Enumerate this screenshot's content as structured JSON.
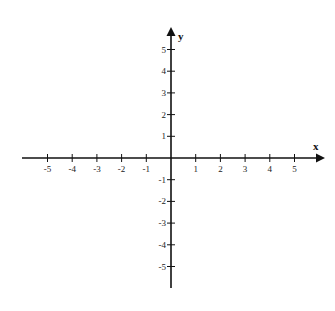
{
  "chart_data": {
    "type": "scatter",
    "title": "",
    "xlabel": "x",
    "ylabel": "y",
    "xlim": [
      -6,
      6
    ],
    "ylim": [
      -6,
      6
    ],
    "grid": false,
    "x_ticks": [
      "-5",
      "-4",
      "-3",
      "-2",
      "-1",
      "1",
      "2",
      "3",
      "4",
      "5"
    ],
    "y_ticks": [
      "5",
      "4",
      "3",
      "2",
      "1",
      "-1",
      "-2",
      "-3",
      "-4",
      "-5"
    ],
    "series": [],
    "colors": {
      "axis": "#111111",
      "background": "#ffffff"
    }
  }
}
